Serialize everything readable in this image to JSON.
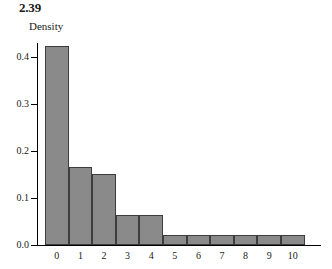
{
  "figure": {
    "label": "2.39"
  },
  "chart_data": {
    "type": "bar",
    "title": "2.39",
    "subtitle": "",
    "xlabel": "",
    "ylabel": "Density",
    "categories": [
      "0",
      "1",
      "2",
      "3",
      "4",
      "5",
      "6",
      "7",
      "8",
      "9",
      "10"
    ],
    "values": [
      0.423,
      0.166,
      0.151,
      0.063,
      0.063,
      0.021,
      0.021,
      0.021,
      0.021,
      0.021,
      0.021
    ],
    "ylim": [
      0.0,
      0.45
    ],
    "yticks": [
      "0.0",
      "0.1",
      "0.2",
      "0.3",
      "0.4"
    ],
    "ytick_values": [
      0.0,
      0.1,
      0.2,
      0.3,
      0.4
    ],
    "grid": false,
    "legend": false,
    "legend_position": "none",
    "bar_color": "#8a8a8a",
    "bar_edge_color": "#3d3d3d",
    "axis_color": "#000000",
    "background_color": "#ffffff",
    "annotations": []
  }
}
